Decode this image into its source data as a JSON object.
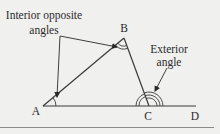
{
  "diagram": {
    "vertices": {
      "A": "A",
      "B": "B",
      "C": "C",
      "D": "D"
    },
    "annotations": {
      "interior": {
        "line1": "Interior opposite",
        "line2": "angles"
      },
      "exterior": {
        "line1": "Exterior",
        "line2": "angle"
      }
    },
    "colors": {
      "background": "#f0f0ef",
      "line": "#3a3a3a",
      "text": "#2a2a2a",
      "border": "#8a8a8a"
    }
  }
}
